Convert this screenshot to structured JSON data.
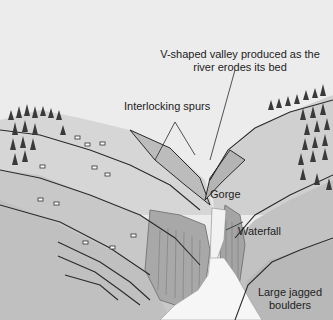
{
  "diagram": {
    "labels": {
      "v_valley": "V-shaped valley produced as the river erodes its bed",
      "v_valley_line1": "V-shaped valley produced as the",
      "v_valley_line2": "river erodes its bed",
      "spurs": "Interlocking spurs",
      "gorge": "Gorge",
      "waterfall": "Waterfall",
      "boulders": "Large jagged boulders",
      "boulders_line1": "Large jagged",
      "boulders_line2": "boulders"
    },
    "colors": {
      "sky": "#ececec",
      "hill_light": "#d4d4d4",
      "hill_mid": "#c4c4c4",
      "hill_dark": "#b0b0b0",
      "water": "#f4f4f4",
      "rock": "#9a9a9a",
      "line": "#2a2a2a",
      "tree": "#3a3a3a"
    }
  }
}
